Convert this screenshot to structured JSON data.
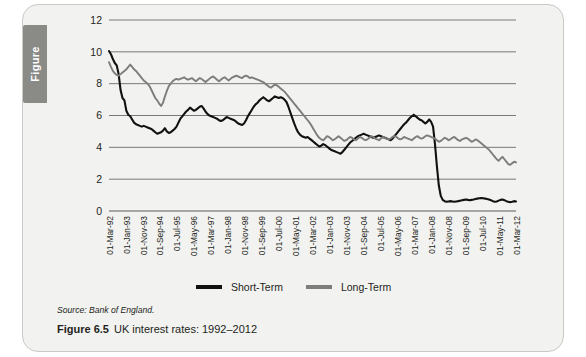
{
  "figure_tab": {
    "label": "Figure"
  },
  "source_note": "Source: Bank of England.",
  "caption": {
    "number": "Figure 6.5",
    "title": "UK interest rates: 1992–2012"
  },
  "legend": {
    "position": "bottom-center",
    "items": [
      {
        "label": "Short-Term",
        "color": "#111111"
      },
      {
        "label": "Long-Term",
        "color": "#7d7d7a"
      }
    ]
  },
  "colors": {
    "short_term": "#111111",
    "long_term": "#7d7d7a",
    "grid": "#6b6b68",
    "card_bg": "#f2f2f0",
    "tab": "#8a8a87"
  },
  "chart_data": {
    "type": "line",
    "title": "UK interest rates: 1992–2012",
    "xlabel": "",
    "ylabel": "",
    "ylim": [
      0,
      12
    ],
    "yticks": [
      0,
      2,
      4,
      6,
      8,
      10,
      12
    ],
    "grid": true,
    "x_tick_labels": [
      "01-Mar-92",
      "01-Jan-93",
      "01-Nov-93",
      "01-Sep-94",
      "01-Jul-95",
      "01-May-96",
      "01-Mar-97",
      "01-Jan-98",
      "01-Nov-98",
      "01-Sep-99",
      "01-Jul-00",
      "01-May-01",
      "01-Mar-02",
      "01-Jan-03",
      "01-Nov-03",
      "01-Sep-04",
      "01-Jul-05",
      "01-May-06",
      "01-Mar-07",
      "01-Jan-08",
      "01-Nov-08",
      "01-Sep-09",
      "01-Jul-10",
      "01-May-11",
      "01-Mar-12"
    ],
    "x_start": "01-Mar-92",
    "x_end": "01-Mar-12",
    "series": [
      {
        "name": "Short-Term",
        "color": "#111111",
        "values": [
          10.05,
          9.85,
          9.55,
          9.3,
          9.15,
          8.6,
          7.6,
          7.1,
          6.95,
          6.3,
          6.05,
          5.95,
          5.75,
          5.55,
          5.45,
          5.4,
          5.35,
          5.3,
          5.35,
          5.3,
          5.25,
          5.2,
          5.15,
          5.05,
          4.95,
          4.85,
          4.9,
          4.95,
          5.05,
          5.2,
          5.0,
          4.9,
          4.95,
          5.05,
          5.15,
          5.3,
          5.55,
          5.8,
          5.95,
          6.1,
          6.25,
          6.35,
          6.5,
          6.4,
          6.3,
          6.35,
          6.45,
          6.55,
          6.6,
          6.45,
          6.25,
          6.1,
          6.0,
          5.95,
          5.9,
          5.85,
          5.8,
          5.7,
          5.65,
          5.7,
          5.8,
          5.9,
          5.85,
          5.8,
          5.75,
          5.7,
          5.6,
          5.5,
          5.45,
          5.4,
          5.5,
          5.7,
          5.95,
          6.15,
          6.35,
          6.55,
          6.7,
          6.8,
          6.95,
          7.05,
          7.15,
          7.05,
          6.95,
          6.9,
          7.0,
          7.1,
          7.2,
          7.15,
          7.1,
          7.15,
          7.1,
          7.0,
          6.85,
          6.55,
          6.2,
          5.85,
          5.5,
          5.2,
          4.95,
          4.8,
          4.7,
          4.65,
          4.6,
          4.65,
          4.55,
          4.45,
          4.35,
          4.25,
          4.15,
          4.05,
          4.1,
          4.2,
          4.15,
          4.05,
          3.95,
          3.85,
          3.8,
          3.75,
          3.7,
          3.65,
          3.6,
          3.7,
          3.85,
          4.0,
          4.15,
          4.3,
          4.4,
          4.5,
          4.6,
          4.7,
          4.75,
          4.8,
          4.85,
          4.8,
          4.75,
          4.7,
          4.65,
          4.6,
          4.65,
          4.7,
          4.75,
          4.7,
          4.65,
          4.6,
          4.55,
          4.5,
          4.45,
          4.55,
          4.7,
          4.85,
          5.0,
          5.15,
          5.3,
          5.45,
          5.55,
          5.7,
          5.85,
          5.95,
          6.05,
          5.95,
          5.85,
          5.75,
          5.7,
          5.6,
          5.5,
          5.6,
          5.75,
          5.6,
          5.3,
          4.2,
          2.8,
          1.6,
          0.95,
          0.7,
          0.62,
          0.58,
          0.6,
          0.62,
          0.6,
          0.58,
          0.6,
          0.62,
          0.65,
          0.68,
          0.7,
          0.72,
          0.7,
          0.68,
          0.7,
          0.72,
          0.75,
          0.78,
          0.8,
          0.82,
          0.8,
          0.78,
          0.75,
          0.72,
          0.68,
          0.62,
          0.58,
          0.6,
          0.65,
          0.7,
          0.72,
          0.68,
          0.62,
          0.58,
          0.55,
          0.58,
          0.62,
          0.6
        ]
      },
      {
        "name": "Long-Term",
        "color": "#7d7d7a",
        "values": [
          9.35,
          9.05,
          8.8,
          8.65,
          8.55,
          8.5,
          8.6,
          8.7,
          8.8,
          8.9,
          9.05,
          9.2,
          9.05,
          8.9,
          8.8,
          8.65,
          8.5,
          8.35,
          8.2,
          8.1,
          8.0,
          7.85,
          7.6,
          7.35,
          7.1,
          6.95,
          6.75,
          6.6,
          6.8,
          7.2,
          7.55,
          7.85,
          8.0,
          8.15,
          8.25,
          8.3,
          8.25,
          8.3,
          8.35,
          8.4,
          8.3,
          8.25,
          8.3,
          8.35,
          8.25,
          8.15,
          8.25,
          8.35,
          8.3,
          8.2,
          8.1,
          8.2,
          8.3,
          8.4,
          8.45,
          8.35,
          8.25,
          8.15,
          8.25,
          8.35,
          8.4,
          8.3,
          8.2,
          8.3,
          8.4,
          8.45,
          8.5,
          8.45,
          8.4,
          8.35,
          8.45,
          8.5,
          8.45,
          8.35,
          8.4,
          8.35,
          8.3,
          8.25,
          8.2,
          8.15,
          8.1,
          8.0,
          7.9,
          7.8,
          7.75,
          7.85,
          7.95,
          7.9,
          7.8,
          7.7,
          7.6,
          7.5,
          7.35,
          7.2,
          7.05,
          6.9,
          6.75,
          6.6,
          6.45,
          6.3,
          6.15,
          6.0,
          5.85,
          5.7,
          5.55,
          5.35,
          5.15,
          4.95,
          4.75,
          4.6,
          4.5,
          4.45,
          4.55,
          4.7,
          4.65,
          4.55,
          4.45,
          4.5,
          4.6,
          4.7,
          4.6,
          4.5,
          4.4,
          4.45,
          4.55,
          4.65,
          4.6,
          4.5,
          4.45,
          4.55,
          4.65,
          4.6,
          4.5,
          4.45,
          4.5,
          4.6,
          4.7,
          4.65,
          4.55,
          4.5,
          4.45,
          4.55,
          4.65,
          4.6,
          4.55,
          4.5,
          4.55,
          4.65,
          4.7,
          4.65,
          4.55,
          4.5,
          4.55,
          4.65,
          4.6,
          4.55,
          4.5,
          4.45,
          4.55,
          4.65,
          4.7,
          4.6,
          4.55,
          4.6,
          4.7,
          4.75,
          4.7,
          4.65,
          4.6,
          4.55,
          4.45,
          4.35,
          4.4,
          4.5,
          4.6,
          4.55,
          4.45,
          4.5,
          4.6,
          4.65,
          4.55,
          4.45,
          4.4,
          4.5,
          4.55,
          4.6,
          4.55,
          4.45,
          4.35,
          4.4,
          4.5,
          4.45,
          4.35,
          4.25,
          4.15,
          4.05,
          3.95,
          3.85,
          3.7,
          3.55,
          3.4,
          3.25,
          3.15,
          3.3,
          3.4,
          3.25,
          3.1,
          2.95,
          2.9,
          3.0,
          3.1,
          3.05
        ]
      }
    ]
  }
}
